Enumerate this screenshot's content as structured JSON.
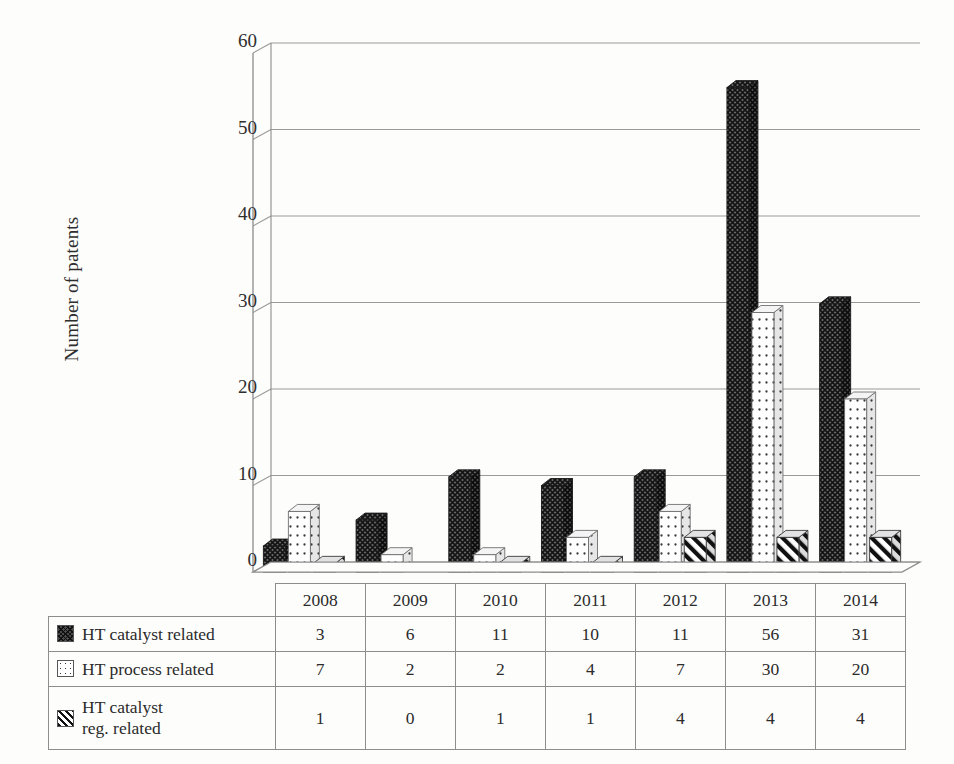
{
  "chart_data": {
    "type": "bar",
    "title": "",
    "subtitle": "",
    "xlabel": "",
    "ylabel": "Number of patents",
    "categories": [
      "2008",
      "2009",
      "2010",
      "2011",
      "2012",
      "2013",
      "2014"
    ],
    "series": [
      {
        "name": "HT catalyst related",
        "pattern": "crosshatch",
        "values": [
          3,
          6,
          11,
          10,
          11,
          56,
          31
        ]
      },
      {
        "name": "HT process related",
        "pattern": "dotted",
        "values": [
          7,
          2,
          2,
          4,
          7,
          30,
          20
        ]
      },
      {
        "name": "HT catalyst reg. related",
        "pattern": "diagonal",
        "values": [
          1,
          0,
          1,
          1,
          4,
          4,
          4
        ]
      }
    ],
    "ylim": [
      0,
      60
    ],
    "ytick_values": [
      0,
      10,
      20,
      30,
      40,
      50,
      60
    ],
    "ytick_labels": [
      "0",
      "10",
      "20",
      "30",
      "40",
      "50",
      "60"
    ],
    "grid": true,
    "grid_axis": "y",
    "legend_position": "data-table-left-column",
    "style": "3d-column",
    "colors": {
      "axis": "#8d8d8d",
      "grid": "#9a9a9a",
      "text": "#2b2b2b",
      "background": "#fdfdfb",
      "series_crosshatch": "#4a4a4a",
      "series_dotted": "#ffffff",
      "series_diagonal": "#ffffff"
    }
  },
  "data_table": {
    "header_row": [
      "",
      "2008",
      "2009",
      "2010",
      "2011",
      "2012",
      "2013",
      "2014"
    ],
    "rows": [
      {
        "label": "HT catalyst related",
        "label_line2": "",
        "swatch": "crosshatch",
        "values": [
          "3",
          "6",
          "11",
          "10",
          "11",
          "56",
          "31"
        ]
      },
      {
        "label": "HT process related",
        "label_line2": "",
        "swatch": "dotted",
        "values": [
          "7",
          "2",
          "2",
          "4",
          "7",
          "30",
          "20"
        ]
      },
      {
        "label": "HT catalyst",
        "label_line2": "reg. related",
        "swatch": "diagonal",
        "values": [
          "1",
          "0",
          "1",
          "1",
          "4",
          "4",
          "4"
        ]
      }
    ]
  }
}
